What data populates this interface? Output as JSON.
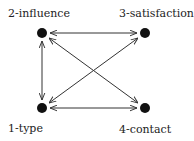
{
  "diagram": {
    "nodes": [
      {
        "id": "1",
        "label": "1-type",
        "x": 42,
        "y": 108,
        "label_x": 8,
        "label_y": 122
      },
      {
        "id": "2",
        "label": "2-influence",
        "x": 42,
        "y": 33,
        "label_x": 8,
        "label_y": 7
      },
      {
        "id": "3",
        "label": "3-satisfaction",
        "x": 145,
        "y": 33,
        "label_x": 119,
        "label_y": 7
      },
      {
        "id": "4",
        "label": "4-contact",
        "x": 145,
        "y": 108,
        "label_x": 119,
        "label_y": 123
      }
    ],
    "edges": [
      {
        "from": "2",
        "to": "3",
        "direction": "both"
      },
      {
        "from": "2",
        "to": "1",
        "direction": "both"
      },
      {
        "from": "1",
        "to": "4",
        "direction": "both"
      },
      {
        "from": "1",
        "to": "3",
        "direction": "both"
      },
      {
        "from": "2",
        "to": "4",
        "direction": "both"
      }
    ],
    "colors": {
      "node": "#111111",
      "edge": "#333333",
      "text": "#222222"
    }
  }
}
